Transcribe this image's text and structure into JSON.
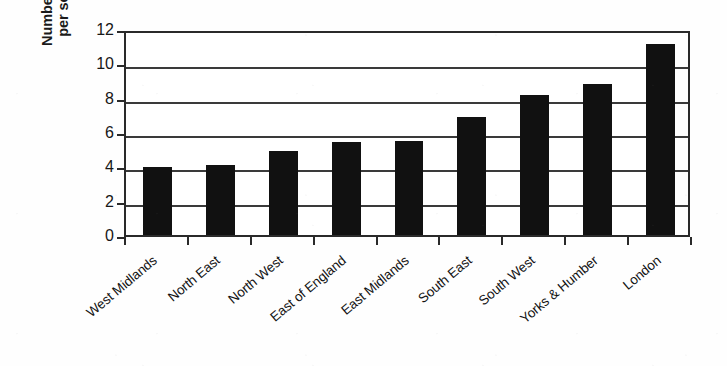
{
  "chart_data": {
    "type": "bar",
    "title": "",
    "xlabel": "",
    "ylabel": "Number on register per social letting",
    "ylabel_lines": [
      "Number on register",
      "per social letting"
    ],
    "categories": [
      "West Midlands",
      "North East",
      "North West",
      "East of England",
      "East Midlands",
      "South East",
      "South West",
      "Yorks & Humber",
      "London"
    ],
    "values": [
      3.95,
      4.05,
      4.9,
      5.4,
      5.45,
      6.85,
      8.15,
      8.8,
      11.1
    ],
    "ylim": [
      0,
      12
    ],
    "ytick_values": [
      0,
      2,
      4,
      6,
      8,
      10,
      12
    ],
    "ytick_labels": [
      "0",
      "2",
      "4",
      "6",
      "8",
      "10",
      "12"
    ],
    "grid": true,
    "grid_axis": "y",
    "legend": false,
    "legend_position": "none",
    "bar_color": "#111111",
    "axis_color": "#2a2a2a",
    "background_color": "#ffffff",
    "xtick_label_rotation": -40
  }
}
